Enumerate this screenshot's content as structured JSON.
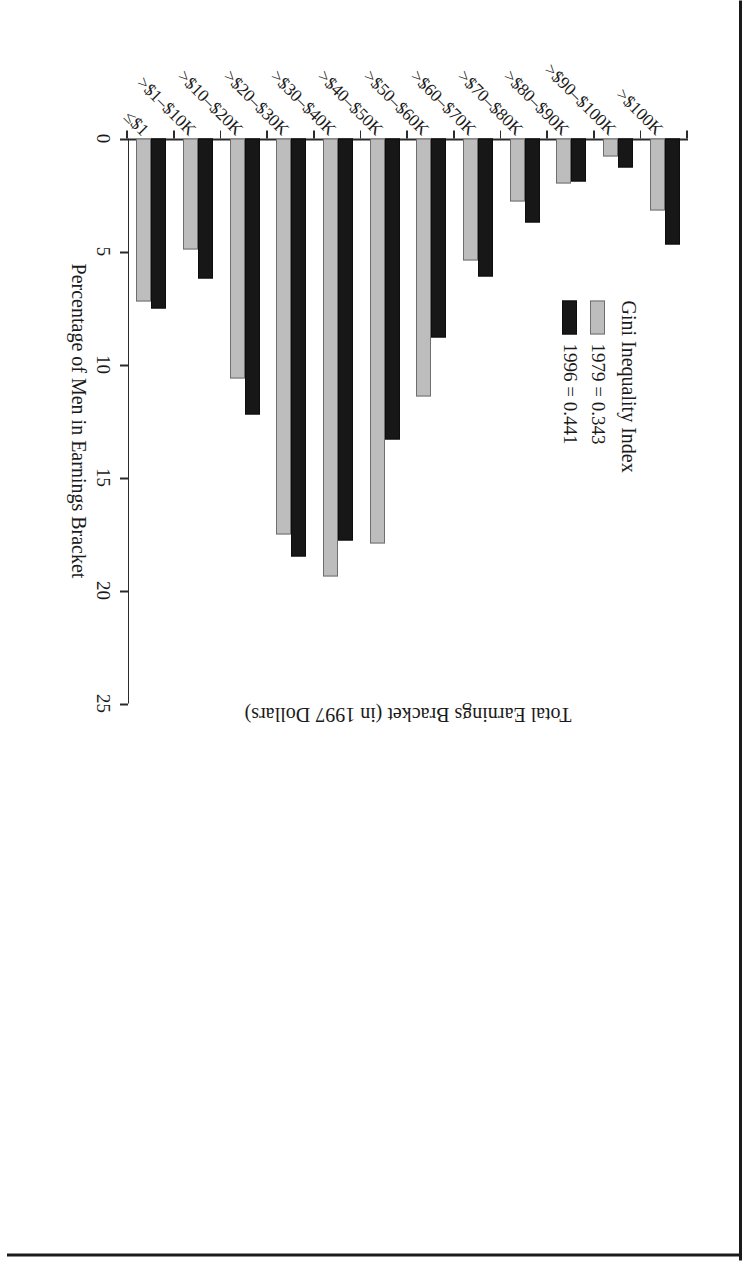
{
  "chart_data": {
    "type": "bar",
    "title": "",
    "xlabel": "Total Earnings Bracket (in 1997 Dollars)",
    "ylabel": "Percentage of Men in Earnings Bracket",
    "ylim": [
      0,
      25
    ],
    "yticks": [
      0,
      5,
      10,
      15,
      20,
      25
    ],
    "ytick_labels": [
      "0",
      "5",
      "10",
      "15",
      "20",
      "25"
    ],
    "grid": false,
    "orientation": "horizontal-rotated",
    "legend_position": "upper-left",
    "categories": [
      "≤$1",
      ">$1–$10K",
      ">$10–$20K",
      ">$20–$30K",
      ">$30–$40K",
      ">$40–$50K",
      ">$50–$60K",
      ">$60–$70K",
      ">$70–$80K",
      ">$80–$90K",
      ">$90–$100K",
      ">$100K"
    ],
    "series": [
      {
        "name": "1979",
        "color": "#bdbdbd",
        "values": [
          7.2,
          4.9,
          10.6,
          17.5,
          19.4,
          17.9,
          11.4,
          5.4,
          2.8,
          2.0,
          0.8,
          3.2
        ]
      },
      {
        "name": "1996",
        "color": "#171717",
        "values": [
          7.5,
          6.2,
          12.2,
          18.5,
          17.8,
          13.3,
          8.8,
          6.1,
          3.7,
          1.9,
          1.3,
          4.7
        ]
      }
    ],
    "annotations": []
  },
  "legend": {
    "title": "Gini Inequality Index",
    "entries": [
      {
        "label": "1979 = 0.343",
        "series": "1979"
      },
      {
        "label": "1996 = 0.441",
        "series": "1996"
      }
    ]
  }
}
